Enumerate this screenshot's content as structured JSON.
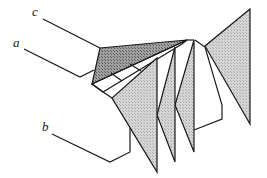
{
  "diagram": {
    "labels": {
      "a": "a",
      "b": "b",
      "c": "c"
    },
    "colors": {
      "line": "#1a1a1a",
      "dark_fill": "#8a8a8a",
      "light_fill": "#cfcfcf",
      "background": "#ffffff"
    }
  }
}
